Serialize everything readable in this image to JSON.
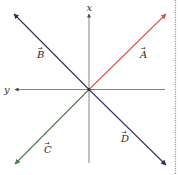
{
  "diagram": {
    "axes": {
      "vertical_label": "x",
      "horizontal_label": "y",
      "axis_color": "#555555"
    },
    "vectors": [
      {
        "id": "A",
        "label": "A",
        "direction": "upper-right",
        "color": "#d9574f"
      },
      {
        "id": "B",
        "label": "B",
        "direction": "upper-left",
        "color": "#2c3155"
      },
      {
        "id": "C",
        "label": "C",
        "direction": "lower-left",
        "color": "#4f7a52"
      },
      {
        "id": "D",
        "label": "D",
        "direction": "lower-right",
        "color": "#3a2f63"
      }
    ],
    "border": {
      "style": "dotted",
      "color": "#d08080"
    }
  }
}
